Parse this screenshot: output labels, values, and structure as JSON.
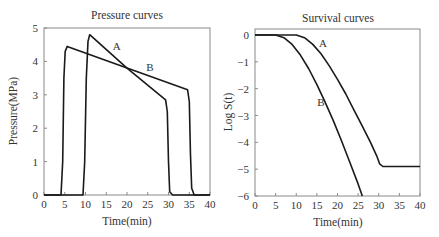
{
  "chart_data": [
    {
      "type": "line",
      "title": "Pressure curves",
      "xlabel": "Time(min)",
      "ylabel": "Pressure(MPa)",
      "xlim": [
        0,
        40
      ],
      "ylim": [
        0,
        5
      ],
      "xticks": [
        "0",
        "5",
        "10",
        "15",
        "20",
        "25",
        "30",
        "35",
        "40"
      ],
      "yticks": [
        "0",
        "1",
        "2",
        "3",
        "4",
        "5"
      ],
      "grid": false,
      "legend": "inline labels",
      "series": [
        {
          "name": "A",
          "x": [
            0,
            9.4,
            9.8,
            10.2,
            10.6,
            11.0,
            20.0,
            29.3,
            29.7,
            30.0,
            30.3,
            31.0,
            40
          ],
          "y": [
            0,
            0,
            1.0,
            3.5,
            4.6,
            4.8,
            3.8,
            2.85,
            2.5,
            1.0,
            0.1,
            0,
            0
          ]
        },
        {
          "name": "B",
          "x": [
            0,
            4.1,
            4.5,
            4.8,
            5.1,
            5.6,
            20.0,
            34.6,
            35.0,
            35.3,
            35.6,
            36.2,
            40
          ],
          "y": [
            0,
            0,
            1.0,
            3.5,
            4.3,
            4.45,
            3.8,
            3.15,
            2.8,
            1.2,
            0.2,
            0,
            0
          ]
        }
      ],
      "annotations": [
        {
          "text": "A",
          "x": 17.5,
          "y": 4.35
        },
        {
          "text": "B",
          "x": 25.5,
          "y": 3.7
        }
      ]
    },
    {
      "type": "line",
      "title": "Survival curves",
      "xlabel": "Time(min)",
      "ylabel": "Log S(t)",
      "xlim": [
        0,
        40
      ],
      "ylim": [
        -6,
        0.25
      ],
      "xticks": [
        "0",
        "5",
        "10",
        "15",
        "20",
        "25",
        "30",
        "35",
        "40"
      ],
      "yticks": [
        "0",
        "-1",
        "-2",
        "-3",
        "-4",
        "-5",
        "-6"
      ],
      "grid": false,
      "legend": "inline labels",
      "series": [
        {
          "name": "A",
          "x": [
            0,
            10,
            12,
            14,
            16,
            18,
            20,
            22,
            24,
            26,
            28,
            29.5,
            30.2,
            31,
            40
          ],
          "y": [
            0,
            0,
            -0.1,
            -0.35,
            -0.7,
            -1.15,
            -1.65,
            -2.2,
            -2.8,
            -3.4,
            -4.0,
            -4.5,
            -4.8,
            -4.9,
            -4.9
          ]
        },
        {
          "name": "B",
          "x": [
            0,
            5,
            7,
            9,
            11,
            13,
            15,
            17,
            19,
            21,
            23,
            25,
            26
          ],
          "y": [
            0,
            0,
            -0.1,
            -0.35,
            -0.75,
            -1.25,
            -1.85,
            -2.5,
            -3.2,
            -3.95,
            -4.75,
            -5.55,
            -6.0
          ]
        }
      ],
      "annotations": [
        {
          "text": "A",
          "x": 16.5,
          "y": -0.45
        },
        {
          "text": "B",
          "x": 16.0,
          "y": -2.65
        }
      ]
    }
  ]
}
